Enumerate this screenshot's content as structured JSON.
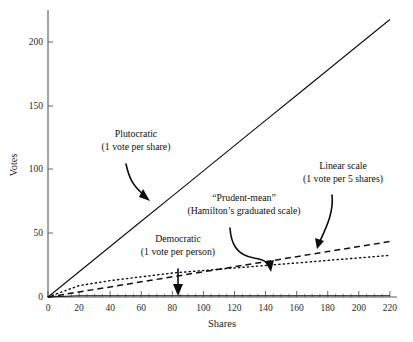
{
  "chart_data": {
    "type": "line",
    "title": "",
    "xlabel": "Shares",
    "ylabel": "Votes",
    "xlim": [
      0,
      222
    ],
    "ylim": [
      0,
      222
    ],
    "xticks": [
      0,
      20,
      40,
      60,
      80,
      100,
      120,
      140,
      160,
      180,
      200,
      220
    ],
    "xtick_labels": [
      "0",
      "20",
      "40",
      "60",
      "80",
      "100",
      "120",
      "140",
      "160",
      "180",
      "200",
      "220"
    ],
    "yticks": [
      0,
      50,
      100,
      150,
      200
    ],
    "ytick_labels": [
      "0",
      "50",
      "100",
      "150",
      "200"
    ],
    "x_minor_tick_step": 5,
    "grid": false,
    "legend": "none (inline annotations with arrows)",
    "x": [
      0,
      20,
      40,
      60,
      80,
      100,
      120,
      140,
      160,
      180,
      200,
      220
    ],
    "series": [
      {
        "name": "Plutocratic",
        "style": "solid",
        "rule": "1 vote per share",
        "values": [
          0,
          20,
          40,
          60,
          80,
          100,
          120,
          140,
          160,
          180,
          200,
          220
        ]
      },
      {
        "name": "Linear scale",
        "style": "dashed",
        "rule": "1 vote per 5 shares",
        "values": [
          0,
          4,
          8,
          12,
          16,
          20,
          24,
          28,
          32,
          36,
          40,
          44
        ]
      },
      {
        "name": "\"Prudent-mean\"",
        "style": "dotted",
        "rule": "Hamilton's graduated scale",
        "values": [
          0,
          9,
          13,
          16,
          19,
          21,
          23,
          25,
          27,
          29,
          31,
          33
        ]
      },
      {
        "name": "Democratic",
        "style": "solid-flat",
        "rule": "1 vote per person",
        "values": [
          0,
          1,
          1,
          1,
          1,
          1,
          1,
          1,
          1,
          1,
          1,
          1
        ]
      }
    ],
    "annotations": [
      {
        "id": "plutocratic",
        "line1": "Plutocratic",
        "line2": "(1 vote per share)",
        "points_to_series": "Plutocratic",
        "target_x": 78,
        "target_y": 72
      },
      {
        "id": "prudent-mean",
        "line1": "“Prudent-mean”",
        "line2": "(Hamilton’s graduated scale)",
        "points_to_series": "\"Prudent-mean\"",
        "target_x": 146,
        "target_y": 26
      },
      {
        "id": "linear-scale",
        "line1": "Linear scale",
        "line2": "(1 vote per 5 shares)",
        "points_to_series": "Linear scale",
        "target_x": 172,
        "target_y": 35
      },
      {
        "id": "democratic",
        "line1": "Democratic",
        "line2": "(1 vote per person)",
        "points_to_series": "Democratic",
        "target_x": 79,
        "target_y": 1
      }
    ]
  },
  "colors": {
    "background": "#ffffff",
    "ink": "#111111",
    "axis": "#5a5a5a"
  }
}
